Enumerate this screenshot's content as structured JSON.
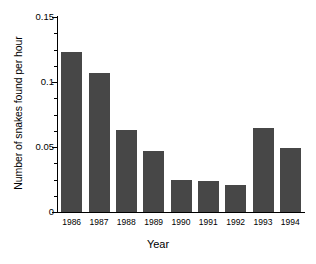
{
  "chart_data": {
    "type": "bar",
    "title": "",
    "xlabel": "Year",
    "ylabel": "Number of snakes found per hour",
    "categories": [
      "1986",
      "1987",
      "1988",
      "1989",
      "1990",
      "1991",
      "1992",
      "1993",
      "1994"
    ],
    "values": [
      0.123,
      0.107,
      0.063,
      0.047,
      0.025,
      0.024,
      0.021,
      0.065,
      0.049
    ],
    "ylim": [
      0,
      0.15
    ],
    "xlim_categories": 9,
    "ytick_labels": [
      "0",
      "0.05",
      "0.1",
      "0.15"
    ],
    "ytick_values": [
      0,
      0.05,
      0.1,
      0.15
    ],
    "yminor_tick_step": 0.0125,
    "grid": false,
    "legend": false,
    "bar_color": "#474747",
    "axis_color": "#000000",
    "background_color": "#ffffff"
  }
}
